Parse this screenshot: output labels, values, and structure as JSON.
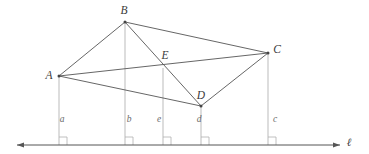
{
  "figure": {
    "canvas": {
      "width": 369,
      "height": 154,
      "background": "#ffffff"
    },
    "style": {
      "edge_color": "#555555",
      "edge_width": 0.9,
      "drop_line_color": "#a9a9a9",
      "drop_line_width": 0.8,
      "baseline_color": "#555555",
      "baseline_width": 1.0,
      "vertex_dot_color": "#444444",
      "label_color": "#3b3b3b",
      "foot_label_color": "#6a6a6a",
      "right_angle_color": "#b0b0b0"
    },
    "baseline": {
      "name": "l",
      "label": "ℓ",
      "y": 145,
      "x_start": 17,
      "x_end": 340,
      "arrows": "both",
      "label_x": 349,
      "label_y": 146
    },
    "vertices": [
      {
        "id": "A",
        "label": "A",
        "x": 59,
        "y": 76,
        "label_x": 49,
        "label_y": 79,
        "dot": true
      },
      {
        "id": "B",
        "label": "B",
        "x": 125,
        "y": 22,
        "label_x": 124,
        "label_y": 14,
        "dot": true
      },
      {
        "id": "C",
        "label": "C",
        "x": 268,
        "y": 53,
        "label_x": 277,
        "label_y": 53,
        "dot": true
      },
      {
        "id": "D",
        "label": "D",
        "x": 201,
        "y": 106,
        "label_x": 201,
        "label_y": 99,
        "dot": true
      },
      {
        "id": "E",
        "label": "E",
        "x": 163,
        "y": 68,
        "label_x": 165,
        "label_y": 59,
        "dot": false
      }
    ],
    "edges": [
      {
        "from": "A",
        "to": "B"
      },
      {
        "from": "B",
        "to": "C"
      },
      {
        "from": "A",
        "to": "C"
      },
      {
        "from": "A",
        "to": "D"
      },
      {
        "from": "D",
        "to": "C"
      },
      {
        "from": "B",
        "to": "D"
      }
    ],
    "feet": [
      {
        "id": "a",
        "label": "a",
        "from": "A",
        "x": 59,
        "label_x": 62,
        "label_y": 122
      },
      {
        "id": "b",
        "label": "b",
        "from": "B",
        "x": 125,
        "label_x": 129,
        "label_y": 122
      },
      {
        "id": "e",
        "label": "e",
        "from": "E",
        "x": 163,
        "label_x": 159,
        "label_y": 122
      },
      {
        "id": "d",
        "label": "d",
        "from": "D",
        "x": 201,
        "label_x": 199,
        "label_y": 122
      },
      {
        "id": "c",
        "label": "c",
        "from": "C",
        "x": 268,
        "label_x": 275,
        "label_y": 122
      }
    ],
    "right_angle_marks": [
      {
        "at": "a",
        "x": 59,
        "size": 8
      },
      {
        "at": "b",
        "x": 125,
        "size": 8
      },
      {
        "at": "e",
        "x": 163,
        "size": 8
      },
      {
        "at": "d",
        "x": 201,
        "size": 8
      },
      {
        "at": "c",
        "x": 268,
        "size": 8
      }
    ]
  }
}
